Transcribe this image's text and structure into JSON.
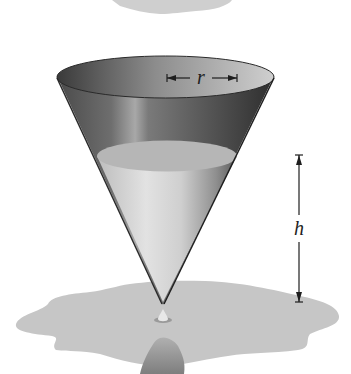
{
  "figure": {
    "labels": {
      "radius": "r",
      "height": "h"
    },
    "colors": {
      "background": "#ffffff",
      "cone_dark": "#3c3c3c",
      "cone_mid": "#8a8a8a",
      "cone_light": "#c8c8c8",
      "water": "#d4d4d4",
      "water_surface": "#b4b4b4",
      "puddle": "#c6c6c6",
      "reflection": "#909090",
      "annotation": "#1e1e1e"
    }
  }
}
